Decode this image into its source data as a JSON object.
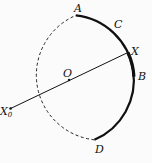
{
  "diagram": {
    "type": "circle-arcs",
    "center": {
      "label": "O",
      "x": 69,
      "y": 80
    },
    "radius": 65,
    "points": [
      {
        "label": "A",
        "angle_deg": -84
      },
      {
        "label": "C",
        "angle_deg": -52
      },
      {
        "label": "X",
        "angle_deg": -25
      },
      {
        "label": "B",
        "angle_deg": -3
      },
      {
        "label": "D",
        "angle_deg": 67
      },
      {
        "label": "X",
        "subscript": "0",
        "angle_deg": 154
      }
    ],
    "arcs": [
      {
        "from": "A",
        "to": "D",
        "style": "solid-thick"
      },
      {
        "from": "X",
        "to": "B",
        "style": "solid-thicker"
      },
      {
        "from": "D",
        "to": "A",
        "style": "dashed"
      }
    ],
    "segments": [
      {
        "from": "X0",
        "to": "X",
        "through": "O"
      }
    ],
    "labels": {
      "A": "A",
      "C": "C",
      "X": "X",
      "B": "B",
      "O": "O",
      "D": "D",
      "X0": "X",
      "X0_sub": "0"
    }
  }
}
